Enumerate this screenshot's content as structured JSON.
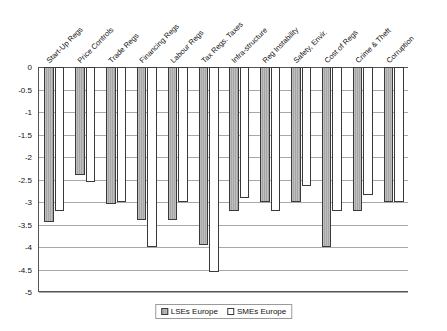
{
  "chart_data": {
    "type": "bar",
    "title": "",
    "xlabel": "",
    "ylabel": "",
    "ylim": [
      -5,
      0
    ],
    "grid": true,
    "legend_position": "bottom-center",
    "orientation": "vertical",
    "categories": [
      "Start-Up Regs",
      "Price Controls",
      "Trade Regs",
      "Financing Regs",
      "Labour Regs",
      "Tax Regs. Taxes",
      "Infra-structure",
      "Reg Instability",
      "Safety, Envir.",
      "Cost of Regs",
      "Crime & Theft",
      "Corruption"
    ],
    "ytick_labels": [
      "0",
      "-0.5",
      "-1",
      "-1.5",
      "-2",
      "-2.5",
      "-3",
      "-3.5",
      "-4",
      "-4.5",
      "-5"
    ],
    "ytick_values": [
      0,
      -0.5,
      -1,
      -1.5,
      -2,
      -2.5,
      -3,
      -3.5,
      -4,
      -4.5,
      -5
    ],
    "series": [
      {
        "name": "LSEs Europe",
        "color": "#a6a6a6",
        "values": [
          -3.45,
          -2.4,
          -3.05,
          -3.4,
          -3.4,
          -3.95,
          -3.2,
          -3.0,
          -3.0,
          -4.0,
          -3.2,
          -3.0
        ]
      },
      {
        "name": "SMEs Europe",
        "color": "#ffffff",
        "values": [
          -3.2,
          -2.55,
          -3.0,
          -4.0,
          -3.0,
          -4.55,
          -2.9,
          -3.2,
          -2.65,
          -3.2,
          -2.85,
          -3.0
        ]
      }
    ]
  },
  "legend": {
    "items": [
      {
        "label": "LSEs Europe"
      },
      {
        "label": "SMEs Europe"
      }
    ]
  }
}
